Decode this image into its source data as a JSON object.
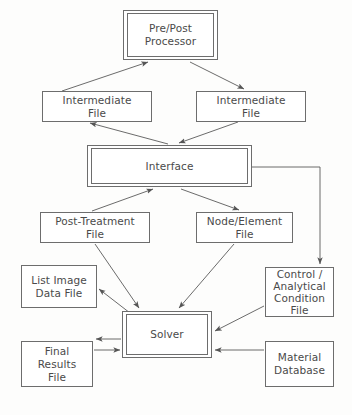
{
  "diagram": {
    "type": "flowchart",
    "title": "",
    "style": {
      "box_border_color": "#6d6d6d",
      "text_color": "#4a4a4a",
      "edge_color": "#595959",
      "background_color": "#fdfdfc"
    },
    "nodes": [
      {
        "id": "pre-post-processor",
        "label": "Pre/Post\nProcessor",
        "shape": "double-rectangle",
        "x": 123,
        "y": 10,
        "w": 95,
        "h": 50
      },
      {
        "id": "intermediate-file-left",
        "label": "Intermediate\nFile",
        "shape": "rectangle",
        "x": 42,
        "y": 91,
        "w": 110,
        "h": 31
      },
      {
        "id": "intermediate-file-right",
        "label": "Intermediate\nFile",
        "shape": "rectangle",
        "x": 196,
        "y": 91,
        "w": 110,
        "h": 31
      },
      {
        "id": "interface",
        "label": "Interface",
        "shape": "double-rectangle",
        "x": 87,
        "y": 145,
        "w": 165,
        "h": 42
      },
      {
        "id": "post-treatment-file",
        "label": "Post-Treatment\nFile",
        "shape": "rectangle",
        "x": 40,
        "y": 212,
        "w": 110,
        "h": 31
      },
      {
        "id": "node-element-file",
        "label": "Node/Element\nFile",
        "shape": "rectangle",
        "x": 196,
        "y": 212,
        "w": 97,
        "h": 31
      },
      {
        "id": "list-image-data-file",
        "label": "List Image\nData File",
        "shape": "rectangle",
        "x": 21,
        "y": 265,
        "w": 76,
        "h": 43
      },
      {
        "id": "control-analytical-condition-file",
        "label": "Control /\nAnalytical\nCondition\nFile",
        "shape": "rectangle",
        "x": 265,
        "y": 267,
        "w": 69,
        "h": 50
      },
      {
        "id": "solver",
        "label": "Solver",
        "shape": "double-rectangle",
        "x": 122,
        "y": 311,
        "w": 90,
        "h": 47
      },
      {
        "id": "final-results-file",
        "label": "Final\nResults\nFile",
        "shape": "rectangle",
        "x": 21,
        "y": 341,
        "w": 72,
        "h": 46
      },
      {
        "id": "material-database",
        "label": "Material\nDatabase",
        "shape": "rectangle",
        "x": 265,
        "y": 341,
        "w": 69,
        "h": 46
      }
    ],
    "edges": [
      {
        "from": "intermediate-file-left",
        "to": "pre-post-processor",
        "path": "62,91 148,62",
        "arrow": "end"
      },
      {
        "from": "pre-post-processor",
        "to": "intermediate-file-right",
        "path": "190,62 244,90",
        "arrow": "end"
      },
      {
        "from": "intermediate-file-right",
        "to": "interface",
        "path": "238,122 178,144",
        "arrow": "end"
      },
      {
        "from": "interface",
        "to": "intermediate-file-left",
        "path": "170,144 90,123",
        "arrow": "end"
      },
      {
        "from": "post-treatment-file",
        "to": "interface",
        "path": "92,211 152,189",
        "arrow": "end"
      },
      {
        "from": "interface",
        "to": "node-element-file",
        "path": "182,189 238,211",
        "arrow": "end"
      },
      {
        "from": "interface",
        "to": "control-analytical-condition-file",
        "path": "252,167 320,167 320,265",
        "arrow": "end"
      },
      {
        "from": "post-treatment-file",
        "to": "solver",
        "path": "95,243 138,309",
        "arrow": "end"
      },
      {
        "from": "node-element-file",
        "to": "solver",
        "path": "235,243 178,309",
        "arrow": "end"
      },
      {
        "from": "control-analytical-condition-file",
        "to": "solver",
        "path": "264,305 214,330",
        "arrow": "end"
      },
      {
        "from": "solver",
        "to": "list-image-data-file",
        "path": "130,312 99,288",
        "arrow": "end"
      },
      {
        "from": "solver",
        "to": "final-results-file",
        "path": "121,339 95,339",
        "arrow": "end"
      },
      {
        "from": "final-results-file",
        "to": "solver",
        "path": "95,350 121,350",
        "arrow": "end"
      },
      {
        "from": "material-database",
        "to": "solver",
        "path": "264,350 214,350",
        "arrow": "end"
      }
    ]
  }
}
